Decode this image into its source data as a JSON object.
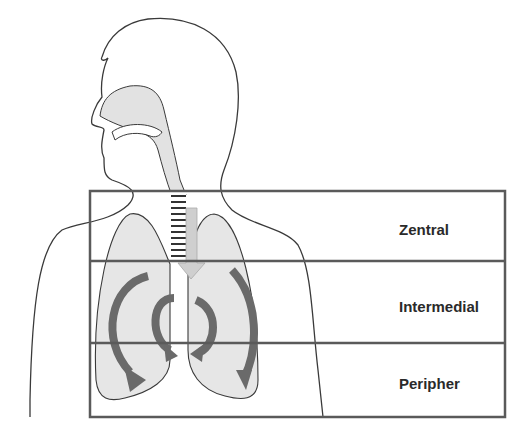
{
  "diagram": {
    "zones": [
      {
        "label": "Zentral"
      },
      {
        "label": "Intermedial"
      },
      {
        "label": "Peripher"
      }
    ]
  },
  "colors": {
    "outline": "#3a3a3a",
    "fill_light": "#e4e4e4",
    "arrow": "#6a6a6a",
    "box": "#5a5a5a",
    "text": "#2a2a2a"
  }
}
